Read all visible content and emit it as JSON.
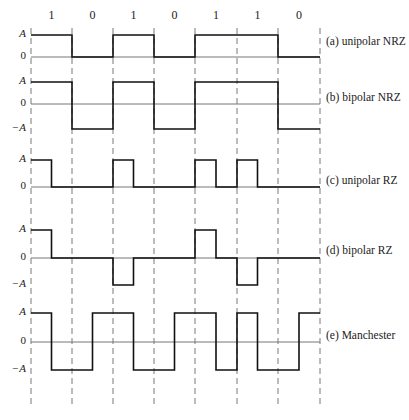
{
  "bits": [
    "1",
    "0",
    "1",
    "0",
    "1",
    "1",
    "0"
  ],
  "bit_boundaries_x": [
    31,
    72,
    113,
    154,
    195,
    237,
    278,
    320
  ],
  "waveforms": [
    {
      "label": "(a) unipolar NRZ",
      "axis": [
        "A",
        "0"
      ],
      "levels_y": {
        "A": 35,
        "0": 57
      },
      "label_y": 42
    },
    {
      "label": "(b) bipolar NRZ",
      "axis": [
        "A",
        "0",
        "−A"
      ],
      "levels_y": {
        "A": 82,
        "0": 104,
        "-A": 129
      },
      "label_y": 98
    },
    {
      "label": "(c) unipolar RZ",
      "axis": [
        "A",
        "0"
      ],
      "levels_y": {
        "A": 160,
        "0": 187
      },
      "label_y": 181
    },
    {
      "label": "(d) bipolar RZ",
      "axis": [
        "A",
        "0",
        "−A"
      ],
      "levels_y": {
        "A": 230,
        "0": 258,
        "-A": 285
      },
      "label_y": 251
    },
    {
      "label": "(e) Manchester",
      "axis": [
        "A",
        "0",
        "−A"
      ],
      "levels_y": {
        "A": 313,
        "0": 342,
        "-A": 370
      },
      "label_y": 336
    }
  ],
  "colors": {
    "signal": "#111111",
    "baseline": "#777777",
    "grid": "#555555"
  }
}
